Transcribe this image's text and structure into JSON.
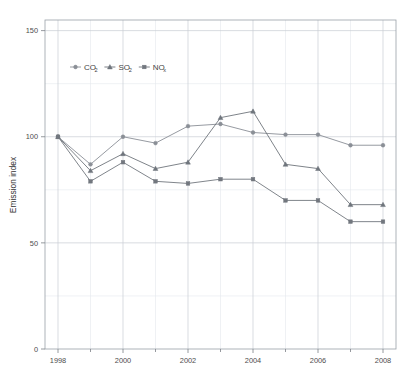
{
  "figure": {
    "background": "#ffffff",
    "plot_area": {
      "left": 45,
      "top": 20,
      "right": 396,
      "bottom": 349
    }
  },
  "chart_data": {
    "type": "line",
    "title": "",
    "subtitle": "",
    "xlabel": "",
    "ylabel": "Emission index",
    "x": [
      1998,
      1999,
      2000,
      2001,
      2002,
      2003,
      2004,
      2005,
      2006,
      2007,
      2008
    ],
    "xlim": [
      1997.6,
      2008.4
    ],
    "ylim": [
      0,
      155
    ],
    "xticks_major": [
      1998,
      2000,
      2002,
      2004,
      2006,
      2008
    ],
    "xticks_major_labels": [
      "1998",
      "2000",
      "2002",
      "2004",
      "2006",
      "2008"
    ],
    "xticks_minor": [
      1999,
      2001,
      2003,
      2005,
      2007
    ],
    "yticks_major": [
      0,
      50,
      100,
      150
    ],
    "yticks_major_labels": [
      "0",
      "50",
      "100",
      "150"
    ],
    "yticks_minor": [
      25,
      75,
      125
    ],
    "grid": true,
    "grid_color_major": "#c9cdd4",
    "grid_color_minor": "#e4e7ec",
    "legend_position": "upper left inside",
    "series": [
      {
        "name": "CO2",
        "label_main": "CO",
        "label_sub": "2",
        "marker": "circle",
        "color": "#8a8f96",
        "values": [
          100,
          87,
          100,
          97,
          105,
          106,
          102,
          101,
          101,
          96,
          96
        ]
      },
      {
        "name": "SO2",
        "label_main": "SO",
        "label_sub": "2",
        "marker": "triangle",
        "color": "#6f757c",
        "values": [
          100,
          84,
          92,
          85,
          88,
          109,
          112,
          87,
          85,
          68,
          68
        ]
      },
      {
        "name": "NOx",
        "label_main": "NO",
        "label_sub": "x",
        "marker": "square",
        "color": "#72777e",
        "values": [
          100,
          79,
          88,
          79,
          78,
          80,
          80,
          70,
          70,
          60,
          60
        ]
      }
    ]
  }
}
